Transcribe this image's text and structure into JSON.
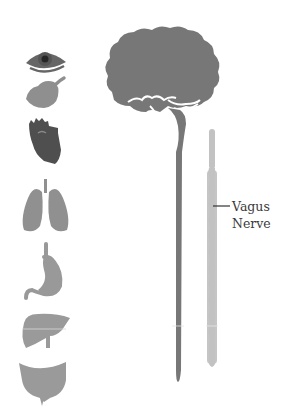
{
  "colors": {
    "dark": "#5c5c5c",
    "brain": "#777777",
    "spine": "#7a7a7a",
    "organ": "#999999",
    "nerve": "#bdbdbd",
    "eye_pupil": "#2b2b2b",
    "eye_iris": "#6a6a6a",
    "heart": "#4f4f4f",
    "text": "#3a3a3a"
  },
  "organs": [
    {
      "name": "eye"
    },
    {
      "name": "salivary-gland"
    },
    {
      "name": "heart"
    },
    {
      "name": "lungs"
    },
    {
      "name": "stomach"
    },
    {
      "name": "liver"
    },
    {
      "name": "intestine"
    }
  ],
  "label": {
    "line1": "Vagus",
    "line2": "Nerve"
  }
}
